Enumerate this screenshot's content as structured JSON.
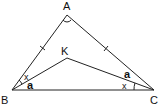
{
  "diagram": {
    "points": {
      "A": {
        "label": "A",
        "x": 67,
        "y": 15
      },
      "B": {
        "label": "B",
        "x": 12,
        "y": 90
      },
      "C": {
        "label": "C",
        "x": 154,
        "y": 90
      },
      "K": {
        "label": "K",
        "x": 67,
        "y": 58
      }
    },
    "segments": [
      "AB",
      "AC",
      "BC",
      "BK",
      "KC"
    ],
    "equal_marks": [
      "AB",
      "AC"
    ],
    "angle_labels": {
      "ABK": "x",
      "KBC": "a",
      "KCA": "a",
      "KCB": "x"
    },
    "apex_angle_marker": "A"
  }
}
